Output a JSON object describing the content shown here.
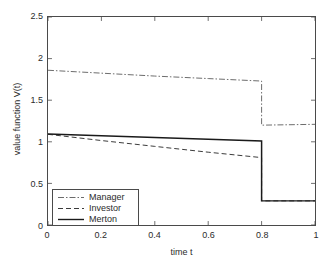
{
  "chart_data": {
    "type": "line",
    "title": "",
    "xlabel": "time t",
    "ylabel": "value function V(t)",
    "xlim": [
      0,
      1
    ],
    "ylim": [
      0,
      2.5
    ],
    "grid": false,
    "legend_position": "lower left",
    "xticks": [
      "0",
      "0.2",
      "0.4",
      "0.6",
      "0.8",
      "1"
    ],
    "xtick_values": [
      0,
      0.2,
      0.4,
      0.6,
      0.8,
      1
    ],
    "yticks": [
      "0",
      "0.5",
      "1",
      "1.5",
      "2",
      "2.5"
    ],
    "ytick_values": [
      0,
      0.5,
      1,
      1.5,
      2,
      2.5
    ],
    "jump_time": 0.8,
    "series": [
      {
        "name": "Manager",
        "style": "dash-dot",
        "color": "#6b6b6b",
        "x": [
          0,
          0.2,
          0.4,
          0.6,
          0.8,
          0.8,
          1.0
        ],
        "values": [
          1.86,
          1.825,
          1.79,
          1.76,
          1.73,
          1.2,
          1.21
        ]
      },
      {
        "name": "Investor",
        "style": "dashed",
        "color": "#3a3a3a",
        "x": [
          0,
          0.2,
          0.4,
          0.6,
          0.8,
          0.8,
          1.0
        ],
        "values": [
          1.09,
          1.015,
          0.945,
          0.875,
          0.81,
          0.29,
          0.29
        ]
      },
      {
        "name": "Merton",
        "style": "solid",
        "color": "#1a1a1a",
        "x": [
          0,
          0.2,
          0.4,
          0.6,
          0.8,
          0.8,
          1.0
        ],
        "values": [
          1.095,
          1.073,
          1.052,
          1.031,
          1.01,
          0.29,
          0.29
        ]
      }
    ]
  },
  "legend": {
    "items": [
      {
        "label": "Manager"
      },
      {
        "label": "Investor"
      },
      {
        "label": "Merton"
      }
    ]
  }
}
